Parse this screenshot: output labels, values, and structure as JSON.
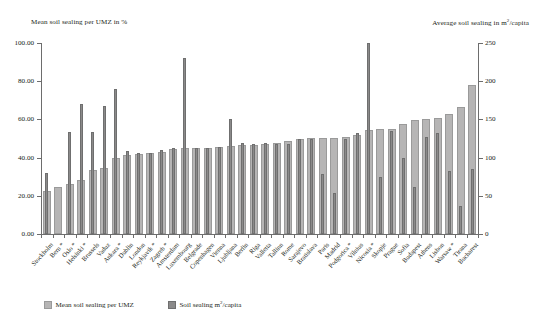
{
  "axes": {
    "left_title": "Mean soil sealing per UMZ in %",
    "right_title_pre": "Average soil sealing in m",
    "right_title_sup": "2",
    "right_title_post": "/capita",
    "left_ticks": [
      "0.00",
      "20.00",
      "40.00",
      "60.00",
      "80.00",
      "100.00"
    ],
    "right_ticks": [
      "0",
      "50",
      "100",
      "150",
      "200",
      "250"
    ],
    "left_min": 0,
    "left_max": 100,
    "right_min": 0,
    "right_max": 250
  },
  "legend": [
    {
      "label_pre": "Mean soil sealing per UMZ",
      "label_sup": "",
      "label_post": "",
      "color": "#b6b5b5",
      "series": "mean_umz"
    },
    {
      "label_pre": "Soil sealing m",
      "label_sup": "2",
      "label_post": "/capita",
      "color": "#8b8a8a",
      "series": "per_capita"
    }
  ],
  "chart_data": {
    "type": "bar",
    "title": "",
    "xlabel": "",
    "ylabel": "Mean soil sealing per UMZ in %",
    "ylabel_secondary": "Average soil sealing in m2/capita",
    "ylim": [
      0,
      100
    ],
    "ylim_secondary": [
      0,
      250
    ],
    "grid": false,
    "legend_position": "bottom-left",
    "categories": [
      "Stockholm",
      "Bern *",
      "Oslo *",
      "Helsinki *",
      "Brussels",
      "Vaduz",
      "Ankara *",
      "Dublin",
      "London",
      "Reykjavik *",
      "Zagreb *",
      "Amsterdam",
      "Luxembourg",
      "Belgrade",
      "Copenhagen",
      "Vienna",
      "Ljubljana",
      "Berlin",
      "Riga",
      "Valletta",
      "Tallinn",
      "Rome",
      "Sarajevo",
      "Bratislava",
      "Paris",
      "Madrid",
      "Podgorica *",
      "Vilnius",
      "Nicosia *",
      "Skopje",
      "Prague",
      "Sofia",
      "Budapest",
      "Athens",
      "Lisbon",
      "Warsaw *",
      "Tirana",
      "Bucharest"
    ],
    "series": [
      {
        "name": "Mean soil sealing per UMZ",
        "axis": "left",
        "unit": "%",
        "values": [
          22.5,
          24.5,
          26.0,
          28.5,
          33.5,
          34.5,
          40.0,
          41.5,
          42.0,
          42.5,
          43.0,
          44.5,
          45.0,
          45.0,
          45.0,
          45.5,
          46.0,
          46.5,
          46.5,
          47.0,
          47.5,
          48.5,
          50.0,
          50.5,
          50.5,
          50.5,
          51.0,
          52.0,
          54.5,
          55.0,
          55.0,
          57.5,
          59.5,
          60.0,
          60.5,
          63.0,
          66.5,
          78.0
        ]
      },
      {
        "name": "Soil sealing m2/capita",
        "axis": "right",
        "unit": "m2/capita",
        "values": [
          80.0,
          null,
          134.0,
          170.0,
          133.0,
          168.0,
          190.0,
          109.0,
          106.0,
          106.0,
          110.0,
          112.0,
          231.0,
          112.0,
          113.0,
          114.0,
          150.0,
          119.0,
          118.0,
          119.0,
          118.0,
          118.0,
          124.0,
          124.0,
          78.0,
          54.0,
          125.0,
          132.0,
          250.0,
          74.0,
          135.0,
          100.0,
          62.0,
          127.0,
          132.0,
          82.0,
          37.0,
          85.0
        ]
      }
    ]
  }
}
